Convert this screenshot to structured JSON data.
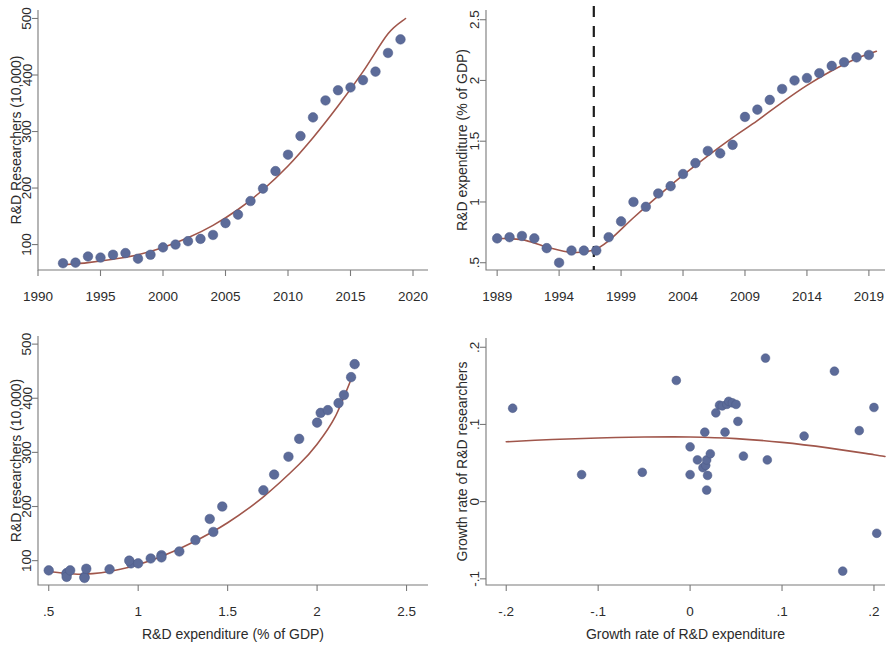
{
  "figure": {
    "panel_count": 4,
    "marker_color": "#5c6b99",
    "fit_line_color": "#a0564b",
    "cut_line_color": "#1c1c1c",
    "axis_color": "#7a7a7a",
    "background": "#ffffff"
  },
  "chart_data": [
    {
      "id": "panel-top-left",
      "type": "scatter",
      "title": "",
      "xlabel": "",
      "ylabel": "R&D Researchers (10,000)",
      "xlim": [
        1990,
        2021.2
      ],
      "ylim": [
        55,
        515
      ],
      "xticks": [
        1990,
        1995,
        2000,
        2005,
        2010,
        2015,
        2020
      ],
      "xticklabels": [
        "1990",
        "1995",
        "2000",
        "2005",
        "2010",
        "2015",
        "2020"
      ],
      "yticks": [
        100,
        200,
        300,
        400,
        500
      ],
      "yticklabels": [
        "100",
        "200",
        "300",
        "400",
        "500"
      ],
      "grid": false,
      "legend": "none",
      "x": [
        1992,
        1993,
        1994,
        1995,
        1996,
        1997,
        1998,
        1999,
        2000,
        2001,
        2002,
        2003,
        2004,
        2005,
        2006,
        2007,
        2008,
        2009,
        2010,
        2011,
        2012,
        2013,
        2014,
        2015,
        2016,
        2017,
        2018,
        2019
      ],
      "y": [
        67,
        68,
        79,
        77,
        82,
        85,
        75,
        82,
        95,
        100,
        106,
        110,
        117,
        138,
        153,
        177,
        199,
        230,
        259,
        292,
        325,
        355,
        373,
        378,
        391,
        406,
        439,
        463
      ],
      "fit": {
        "kind": "quadratic-trend",
        "x": [
          1992,
          1994,
          1996,
          1998,
          2000,
          2002,
          2004,
          2006,
          2008,
          2010,
          2012,
          2014,
          2016,
          2018,
          2019.4
        ],
        "y": [
          64,
          68,
          74,
          82,
          95,
          112,
          134,
          162,
          197,
          239,
          289,
          345,
          406,
          473,
          500
        ]
      }
    },
    {
      "id": "panel-top-right",
      "type": "scatter",
      "title": "",
      "xlabel": "",
      "ylabel": "R&D expenditure (% of GDP)",
      "xlim": [
        1988.1,
        2020.3
      ],
      "ylim": [
        0.44,
        2.58
      ],
      "xticks": [
        1989,
        1994,
        1999,
        2004,
        2009,
        2014,
        2019
      ],
      "xticklabels": [
        "1989",
        "1994",
        "1999",
        "2004",
        "2009",
        "2014",
        "2019"
      ],
      "yticks": [
        0.5,
        1,
        1.5,
        2,
        2.5
      ],
      "yticklabels": [
        ".5",
        "1",
        "1.5",
        "2",
        "2.5"
      ],
      "grid": false,
      "legend": "none",
      "vline": {
        "x": 1996.8,
        "style": "dashed",
        "label": ""
      },
      "x": [
        1989,
        1990,
        1991,
        1992,
        1993,
        1994,
        1995,
        1996,
        1997,
        1998,
        1999,
        2000,
        2001,
        2002,
        2003,
        2004,
        2005,
        2006,
        2007,
        2008,
        2009,
        2010,
        2011,
        2012,
        2013,
        2014,
        2015,
        2016,
        2017,
        2018,
        2019
      ],
      "y": [
        0.7,
        0.71,
        0.72,
        0.7,
        0.62,
        0.5,
        0.6,
        0.6,
        0.6,
        0.71,
        0.84,
        1.0,
        0.96,
        1.07,
        1.13,
        1.23,
        1.32,
        1.42,
        1.4,
        1.47,
        1.7,
        1.76,
        1.84,
        1.93,
        2.0,
        2.02,
        2.06,
        2.12,
        2.15,
        2.19,
        2.21
      ],
      "fit": {
        "kind": "piecewise-trend",
        "x": [
          1989,
          1991,
          1993,
          1995,
          1996.8,
          1998,
          2000,
          2002,
          2004,
          2006,
          2008,
          2010,
          2012,
          2014,
          2016,
          2018,
          2019.6
        ],
        "y": [
          0.7,
          0.69,
          0.63,
          0.585,
          0.605,
          0.68,
          0.87,
          1.05,
          1.22,
          1.38,
          1.53,
          1.67,
          1.82,
          1.96,
          2.08,
          2.18,
          2.24
        ]
      }
    },
    {
      "id": "panel-bottom-left",
      "type": "scatter",
      "title": "",
      "xlabel": "R&D expenditure (% of GDP)",
      "ylabel": "R&D researchers (10,000)",
      "xlim": [
        0.44,
        2.62
      ],
      "ylim": [
        55,
        515
      ],
      "xticks": [
        0.5,
        1,
        1.5,
        2,
        2.5
      ],
      "xticklabels": [
        ".5",
        "1",
        "1.5",
        "2",
        "2.5"
      ],
      "yticks": [
        100,
        200,
        300,
        400,
        500
      ],
      "yticklabels": [
        "100",
        "200",
        "300",
        "400",
        "500"
      ],
      "grid": false,
      "legend": "none",
      "x": [
        0.5,
        0.6,
        0.6,
        0.6,
        0.62,
        0.7,
        0.7,
        0.71,
        0.84,
        0.96,
        0.95,
        1.0,
        1.07,
        1.13,
        1.13,
        1.23,
        1.32,
        1.4,
        1.42,
        1.47,
        1.7,
        1.76,
        1.84,
        1.9,
        2.0,
        2.02,
        2.06,
        2.12,
        2.15,
        2.19,
        2.21
      ],
      "y": [
        82,
        77,
        75,
        70,
        82,
        70,
        68,
        85,
        84,
        95,
        100,
        95,
        104,
        110,
        106,
        117,
        138,
        177,
        153,
        200,
        230,
        259,
        292,
        325,
        355,
        373,
        378,
        391,
        406,
        439,
        463
      ],
      "fit": {
        "kind": "quadratic-trend",
        "x": [
          0.5,
          0.7,
          0.9,
          1.1,
          1.3,
          1.5,
          1.7,
          1.9,
          2.0,
          2.1,
          2.2
        ],
        "y": [
          80,
          75,
          84,
          104,
          133,
          170,
          218,
          278,
          315,
          365,
          443
        ]
      }
    },
    {
      "id": "panel-bottom-right",
      "type": "scatter",
      "title": "",
      "xlabel": "Growth rate of R&D expenditure",
      "ylabel": "Growth rate of R&D researchers",
      "xlim": [
        -0.222,
        0.212
      ],
      "ylim": [
        -0.108,
        0.212
      ],
      "xticks": [
        -0.2,
        -0.1,
        0,
        0.1,
        0.2
      ],
      "xticklabels": [
        "-.2",
        "-.1",
        "0",
        ".1",
        ".2"
      ],
      "yticks": [
        -0.1,
        0,
        0.1,
        0.2
      ],
      "yticklabels": [
        "-.1",
        "0",
        ".1",
        ".2"
      ],
      "grid": false,
      "legend": "none",
      "x": [
        -0.193,
        -0.118,
        -0.052,
        -0.015,
        0.0,
        0.0,
        0.008,
        0.014,
        0.016,
        0.017,
        0.018,
        0.018,
        0.019,
        0.022,
        0.028,
        0.032,
        0.035,
        0.038,
        0.04,
        0.042,
        0.046,
        0.05,
        0.052,
        0.058,
        0.082,
        0.084,
        0.124,
        0.157,
        0.166,
        0.184,
        0.2,
        0.203
      ],
      "y": [
        0.121,
        0.035,
        0.038,
        0.157,
        0.071,
        0.035,
        0.054,
        0.044,
        0.09,
        0.047,
        0.054,
        0.015,
        0.034,
        0.062,
        0.115,
        0.125,
        0.124,
        0.09,
        0.126,
        0.13,
        0.128,
        0.126,
        0.104,
        0.059,
        0.186,
        0.054,
        0.085,
        0.169,
        -0.09,
        0.092,
        0.122,
        -0.041
      ],
      "fit": {
        "kind": "quadratic-trend",
        "x": [
          -0.2,
          -0.15,
          -0.1,
          -0.05,
          0.0,
          0.05,
          0.1,
          0.15,
          0.2,
          0.212
        ],
        "y": [
          0.0775,
          0.0805,
          0.0825,
          0.0837,
          0.0838,
          0.0817,
          0.0768,
          0.0697,
          0.0608,
          0.0585
        ]
      }
    }
  ]
}
